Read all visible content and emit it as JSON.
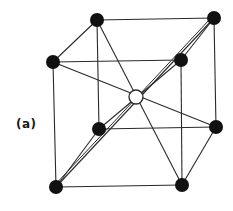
{
  "diagram": {
    "label": "(a)",
    "colors": {
      "line": "#2a2a2a",
      "atom_fill": "#111111",
      "center_fill": "#ffffff",
      "background": "#ffffff"
    },
    "atoms": [
      {
        "id": "back-top-left",
        "x": 97,
        "y": 20,
        "r": 7,
        "type": "corner"
      },
      {
        "id": "back-top-right",
        "x": 214,
        "y": 18,
        "r": 7,
        "type": "corner"
      },
      {
        "id": "front-top-left",
        "x": 53,
        "y": 62,
        "r": 7,
        "type": "corner"
      },
      {
        "id": "front-top-right",
        "x": 181,
        "y": 60,
        "r": 7,
        "type": "corner"
      },
      {
        "id": "back-bottom-left",
        "x": 99,
        "y": 129,
        "r": 7,
        "type": "corner"
      },
      {
        "id": "back-bottom-right",
        "x": 216,
        "y": 127,
        "r": 7,
        "type": "corner"
      },
      {
        "id": "front-bottom-left",
        "x": 56,
        "y": 187,
        "r": 7,
        "type": "corner"
      },
      {
        "id": "front-bottom-right",
        "x": 182,
        "y": 185,
        "r": 7,
        "type": "corner"
      },
      {
        "id": "body-center",
        "x": 136,
        "y": 97,
        "r": 7,
        "type": "center"
      }
    ],
    "edges": [
      [
        "back-top-left",
        "back-top-right"
      ],
      [
        "front-top-left",
        "front-top-right"
      ],
      [
        "back-top-left",
        "front-top-left"
      ],
      [
        "back-top-right",
        "front-top-right"
      ],
      [
        "back-bottom-left",
        "back-bottom-right"
      ],
      [
        "front-bottom-left",
        "front-bottom-right"
      ],
      [
        "back-bottom-left",
        "front-bottom-left"
      ],
      [
        "back-bottom-right",
        "front-bottom-right"
      ],
      [
        "back-top-left",
        "back-bottom-left"
      ],
      [
        "back-top-right",
        "back-bottom-right"
      ],
      [
        "front-top-left",
        "front-bottom-left"
      ],
      [
        "front-top-right",
        "front-bottom-right"
      ]
    ],
    "diagonals": [
      [
        "back-top-left",
        "front-bottom-right"
      ],
      [
        "front-top-left",
        "back-bottom-right"
      ],
      [
        "back-top-right",
        "front-bottom-left"
      ],
      [
        "front-top-right",
        "back-bottom-left"
      ]
    ]
  }
}
